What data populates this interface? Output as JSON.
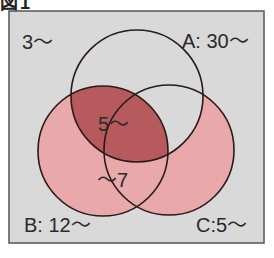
{
  "figure": {
    "header": "図1"
  },
  "colors": {
    "page_background": "#ffffff",
    "box_background": "#d9d9d9",
    "box_border": "#555555",
    "circle_stroke": "#2b1a1a",
    "pink_fill": "#e9a9aa",
    "dark_fill": "#b65a5e"
  },
  "labels": {
    "outside": "3〜",
    "set_a": "A: 30〜",
    "set_b": "B: 12〜",
    "set_c": "C:5〜",
    "a_and_b": "5〜",
    "b_and_c": "〜7"
  },
  "sets": [
    {
      "name": "A",
      "cx": 137,
      "cy": 96,
      "r": 66,
      "shaded": false
    },
    {
      "name": "B",
      "cx": 103,
      "cy": 151,
      "r": 65,
      "shaded": true
    },
    {
      "name": "C",
      "cx": 169,
      "cy": 150,
      "r": 65,
      "shaded": true
    }
  ]
}
